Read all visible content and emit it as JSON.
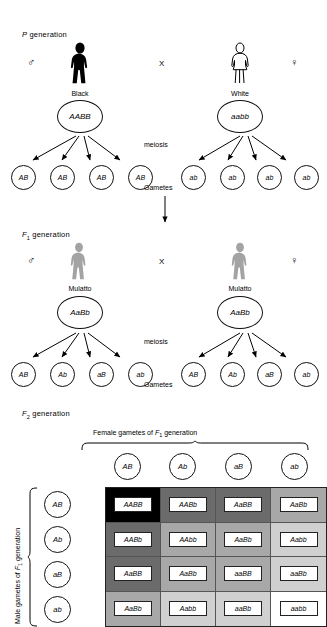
{
  "figure": {
    "generations": {
      "p": {
        "label_prefix": "P",
        "label_suffix": " generation",
        "male_symbol": "♂",
        "female_symbol": "♀",
        "cross_symbol": "X",
        "parents": [
          {
            "phenotype": "Black",
            "genotype": "AABB",
            "sex": "male",
            "silhouette": "solid-black-male-figure"
          },
          {
            "phenotype": "White",
            "genotype": "aabb",
            "sex": "female",
            "silhouette": "outline-white-female-figure"
          }
        ],
        "meiosis_label": "meiosis",
        "gametes_label": "Gametes",
        "male_gametes": [
          "AB",
          "AB",
          "AB",
          "AB"
        ],
        "female_gametes": [
          "ab",
          "ab",
          "ab",
          "ab"
        ]
      },
      "f1": {
        "label_prefix": "F",
        "label_sub": "1",
        "label_suffix": " generation",
        "male_symbol": "♂",
        "female_symbol": "♀",
        "cross_symbol": "X",
        "parents": [
          {
            "phenotype": "Mulatto",
            "genotype": "AaBb",
            "sex": "male",
            "silhouette": "gray-male-figure"
          },
          {
            "phenotype": "Mulatto",
            "genotype": "AaBb",
            "sex": "female",
            "silhouette": "gray-female-figure"
          }
        ],
        "meiosis_label": "meiosis",
        "gametes_label": "Gametes",
        "male_gametes": [
          "AB",
          "Ab",
          "aB",
          "ab"
        ],
        "female_gametes": [
          "AB",
          "Ab",
          "aB",
          "ab"
        ]
      },
      "f2": {
        "label_prefix": "F",
        "label_sub": "2",
        "label_suffix": " generation",
        "column_header": {
          "prefix": "Female gametes of ",
          "gen": "F",
          "sub": "1",
          "suffix": " generation"
        },
        "row_header": {
          "prefix": "Male gametes of ",
          "gen": "F",
          "sub": "1",
          "suffix": " generation"
        },
        "column_gametes": [
          "AB",
          "Ab",
          "aB",
          "ab"
        ],
        "row_gametes": [
          "AB",
          "Ab",
          "aB",
          "ab"
        ]
      }
    }
  },
  "chart_data": {
    "type": "table",
    "columns": [
      "AB",
      "Ab",
      "aB",
      "ab"
    ],
    "rows": [
      "AB",
      "Ab",
      "aB",
      "ab"
    ],
    "cells": [
      [
        {
          "genotype": "AABB",
          "dominant_alleles": 4,
          "shade": "#000000"
        },
        {
          "genotype": "AABb",
          "dominant_alleles": 3,
          "shade": "#6b6b6b"
        },
        {
          "genotype": "AaBB",
          "dominant_alleles": 3,
          "shade": "#6b6b6b"
        },
        {
          "genotype": "AaBb",
          "dominant_alleles": 2,
          "shade": "#a8a8a8"
        }
      ],
      [
        {
          "genotype": "AABb",
          "dominant_alleles": 3,
          "shade": "#6b6b6b"
        },
        {
          "genotype": "AAbb",
          "dominant_alleles": 2,
          "shade": "#a8a8a8"
        },
        {
          "genotype": "AaBb",
          "dominant_alleles": 2,
          "shade": "#a8a8a8"
        },
        {
          "genotype": "Aabb",
          "dominant_alleles": 1,
          "shade": "#d0d0d0"
        }
      ],
      [
        {
          "genotype": "AaBB",
          "dominant_alleles": 3,
          "shade": "#6b6b6b"
        },
        {
          "genotype": "AaBb",
          "dominant_alleles": 2,
          "shade": "#a8a8a8"
        },
        {
          "genotype": "aaBB",
          "dominant_alleles": 2,
          "shade": "#a8a8a8"
        },
        {
          "genotype": "aaBb",
          "dominant_alleles": 1,
          "shade": "#d0d0d0"
        }
      ],
      [
        {
          "genotype": "AaBb",
          "dominant_alleles": 2,
          "shade": "#a8a8a8"
        },
        {
          "genotype": "Aabb",
          "dominant_alleles": 1,
          "shade": "#d0d0d0"
        },
        {
          "genotype": "aaBb",
          "dominant_alleles": 1,
          "shade": "#d0d0d0"
        },
        {
          "genotype": "aabb",
          "dominant_alleles": 0,
          "shade": "#ffffff"
        }
      ]
    ],
    "phenotype_ratio": "1:4:6:4:1",
    "xlabel": "Female gametes of F1 generation",
    "ylabel": "Male gametes of F1 generation"
  }
}
